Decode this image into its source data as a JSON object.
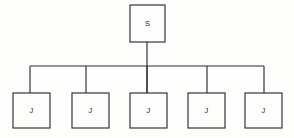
{
  "diagram": {
    "type": "tree",
    "background_color": "#fdfdfc",
    "stroke_color": "#2e2e2e",
    "root": {
      "label": "S",
      "name": "root-node",
      "x": 130,
      "y": 5,
      "width": 35,
      "height": 37
    },
    "bus": {
      "y": 66,
      "x_start": 30,
      "x_end": 264
    },
    "root_stem": {
      "x": 147,
      "y_start": 42,
      "y_end": 93
    },
    "children": [
      {
        "label": "J",
        "name": "child-node-1",
        "x": 13,
        "y": 93,
        "width": 37,
        "height": 35,
        "drop_x": 30
      },
      {
        "label": "J",
        "name": "child-node-2",
        "x": 72,
        "y": 93,
        "width": 37,
        "height": 35,
        "drop_x": 86
      },
      {
        "label": "J",
        "name": "child-node-3",
        "x": 130,
        "y": 93,
        "width": 37,
        "height": 35,
        "drop_x": 147
      },
      {
        "label": "J",
        "name": "child-node-4",
        "x": 188,
        "y": 93,
        "width": 37,
        "height": 35,
        "drop_x": 207
      },
      {
        "label": "J",
        "name": "child-node-5",
        "x": 245,
        "y": 93,
        "width": 37,
        "height": 35,
        "drop_x": 264
      }
    ]
  }
}
